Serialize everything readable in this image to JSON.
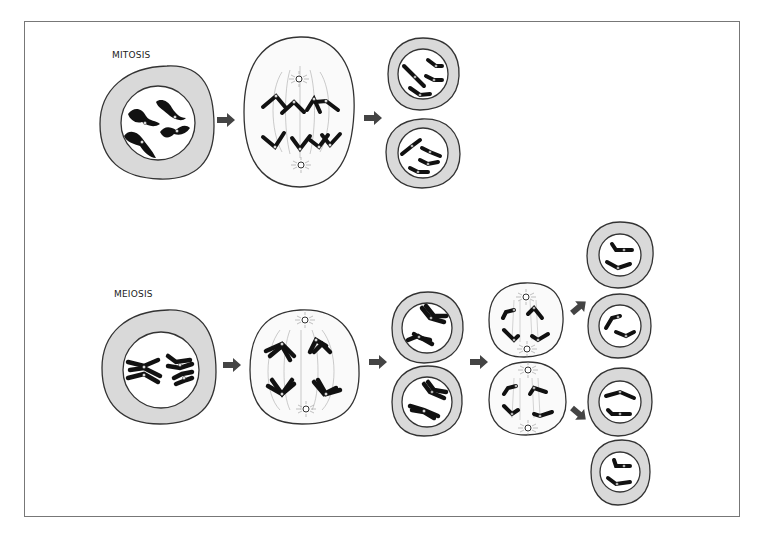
{
  "diagram": {
    "sections": [
      {
        "id": "mitosis",
        "label": "MITOSIS",
        "stages": [
          "parent cell (4 chromosomes)",
          "metaphase/anaphase spindle",
          "2 daughter cells"
        ]
      },
      {
        "id": "meiosis",
        "label": "MEIOSIS",
        "stages": [
          "parent cell (homologous pairs)",
          "meiosis I spindle",
          "2 daughter cells",
          "meiosis II spindles",
          "4 gametes"
        ]
      }
    ],
    "colors": {
      "cytoplasm_ring": "#d9d9d9",
      "nucleus": "#ffffff",
      "outline": "#333333",
      "chromosome": "#111111",
      "arrow": "#444444",
      "frame": "#777777"
    }
  }
}
